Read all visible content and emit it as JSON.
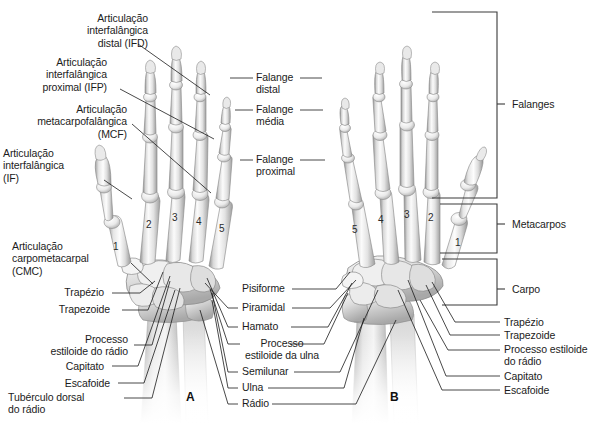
{
  "figure": {
    "title_visible": false,
    "background": "#ffffff",
    "panels": [
      {
        "id": "A",
        "letter": "A",
        "view": "dorsal-view-left-hand",
        "x": 192,
        "y": 398
      },
      {
        "id": "B",
        "letter": "B",
        "view": "palmar-view-right-hand",
        "x": 396,
        "y": 398
      }
    ]
  },
  "colors": {
    "text": "#1c1c1c",
    "leader_line": "#1a1a1a",
    "bracket": "#3a3a3a",
    "bone_light": "#f2f2f2",
    "bone_mid": "#cfcfcf",
    "bone_dark": "#9a9a9a",
    "bone_outline": "#6e6e6e",
    "background": "#ffffff"
  },
  "labels_left": [
    {
      "name": "articulacao-interfalangica-distal",
      "lines": [
        "Articulação",
        "interfalângica",
        "distal (IFD)"
      ],
      "x": 148,
      "y": 12
    },
    {
      "name": "articulacao-interfalangica-proximal",
      "lines": [
        "Articulação",
        "interfalângica",
        "proximal (IFP)"
      ],
      "x": 107,
      "y": 56
    },
    {
      "name": "articulacao-metacarpofalangica",
      "lines": [
        "Articulação",
        "metacarpofalângica",
        "(MCF)"
      ],
      "x": 127,
      "y": 103
    },
    {
      "name": "articulacao-interfalangica",
      "lines": [
        "Articulação",
        "interfalângica",
        "(IF)"
      ],
      "x": 99,
      "y": 147
    },
    {
      "name": "articulacao-carpometacarpal",
      "lines": [
        "Articulação",
        "carpometacarpal",
        "(CMC)"
      ],
      "x": 119,
      "y": 240
    },
    {
      "name": "trapezio",
      "lines": [
        "Trapézio"
      ],
      "x": 104,
      "y": 291
    },
    {
      "name": "trapezoide",
      "lines": [
        "Trapezoide"
      ],
      "x": 110,
      "y": 308
    },
    {
      "name": "processo-estiloide-do-radio",
      "lines": [
        "Processo",
        "estiloide do rádio"
      ],
      "x": 128,
      "y": 328
    },
    {
      "name": "capitato",
      "lines": [
        "Capitato"
      ],
      "x": 104,
      "y": 364
    },
    {
      "name": "escafoide",
      "lines": [
        "Escafoide"
      ],
      "x": 110,
      "y": 381
    },
    {
      "name": "tuberculo-dorsal-do-radio",
      "lines": [
        "Tubérculo dorsal",
        "do rádio"
      ],
      "x": 119,
      "y": 396
    }
  ],
  "labels_center": [
    {
      "name": "falange-distal",
      "lines": [
        "Falange",
        "distal"
      ],
      "x": 258,
      "y": 74
    },
    {
      "name": "falange-media",
      "lines": [
        "Falange",
        "média"
      ],
      "x": 258,
      "y": 105
    },
    {
      "name": "falange-proximal",
      "lines": [
        "Falange",
        "proximal"
      ],
      "x": 258,
      "y": 155
    },
    {
      "name": "pisiforme",
      "lines": [
        "Pisiforme"
      ],
      "x": 248,
      "y": 285
    },
    {
      "name": "piramidal",
      "lines": [
        "Piramidal"
      ],
      "x": 248,
      "y": 304
    },
    {
      "name": "hamato",
      "lines": [
        "Hamato"
      ],
      "x": 248,
      "y": 323
    },
    {
      "name": "processo-estiloide-da-ulna",
      "lines": [
        "Processo",
        "estiloide da ulna"
      ],
      "x": 238,
      "y": 340
    },
    {
      "name": "semilunar",
      "lines": [
        "Semilunar"
      ],
      "x": 248,
      "y": 368
    },
    {
      "name": "ulna",
      "lines": [
        "Ulna"
      ],
      "x": 248,
      "y": 384
    },
    {
      "name": "radio",
      "lines": [
        "Rádio"
      ],
      "x": 248,
      "y": 400
    }
  ],
  "labels_right": [
    {
      "name": "falanges",
      "lines": [
        "Falanges"
      ],
      "x": 516,
      "y": 98
    },
    {
      "name": "metacarpos",
      "lines": [
        "Metacarpos"
      ],
      "x": 516,
      "y": 218
    },
    {
      "name": "carpo",
      "lines": [
        "Carpo"
      ],
      "x": 516,
      "y": 283
    },
    {
      "name": "trapezio",
      "lines": [
        "Trapézio"
      ],
      "x": 506,
      "y": 318
    },
    {
      "name": "trapezoide",
      "lines": [
        "Trapezoide"
      ],
      "x": 506,
      "y": 331
    },
    {
      "name": "processo-estiloide-do-radio",
      "lines": [
        "Processo estiloide",
        "do rádio"
      ],
      "x": 506,
      "y": 345
    },
    {
      "name": "capitato",
      "lines": [
        "Capitato"
      ],
      "x": 506,
      "y": 372
    },
    {
      "name": "escafoide",
      "lines": [
        "Escafoide"
      ],
      "x": 506,
      "y": 386
    }
  ],
  "brackets": [
    {
      "name": "bracket-falanges",
      "top": 12,
      "bottom": 198,
      "label": "Falanges"
    },
    {
      "name": "bracket-metacarpos",
      "top": 204,
      "bottom": 253,
      "label": "Metacarpos"
    },
    {
      "name": "bracket-carpo",
      "top": 259,
      "bottom": 305,
      "label": "Carpo"
    }
  ],
  "digits_hand_a": [
    {
      "value": "1",
      "x": 113,
      "y": 241
    },
    {
      "value": "2",
      "x": 146,
      "y": 219
    },
    {
      "value": "3",
      "x": 172,
      "y": 212
    },
    {
      "value": "4",
      "x": 196,
      "y": 216
    },
    {
      "value": "5",
      "x": 219,
      "y": 223
    }
  ],
  "digits_hand_b": [
    {
      "value": "5",
      "x": 352,
      "y": 224
    },
    {
      "value": "4",
      "x": 378,
      "y": 214
    },
    {
      "value": "3",
      "x": 404,
      "y": 209
    },
    {
      "value": "2",
      "x": 428,
      "y": 212
    },
    {
      "value": "1",
      "x": 455,
      "y": 237
    }
  ]
}
